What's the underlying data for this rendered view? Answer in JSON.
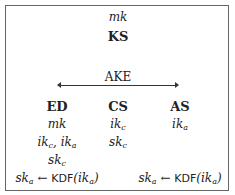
{
  "ks": {
    "key": "mk",
    "label": "KS"
  },
  "ake": {
    "label": "AKE"
  },
  "columns": [
    {
      "label": "ED",
      "items": [
        "mk",
        "ikc, ika",
        "skc",
        "ska ← KDF(ika)"
      ]
    },
    {
      "label": "CS",
      "items": [
        "ikc",
        "skc"
      ]
    },
    {
      "label": "AS",
      "items": [
        "ika",
        "ska ← KDF(ika)"
      ]
    }
  ]
}
